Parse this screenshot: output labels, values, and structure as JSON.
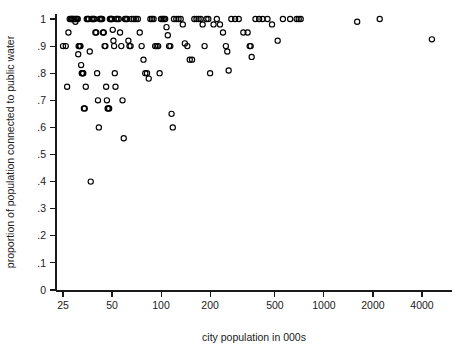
{
  "chart_data": {
    "type": "scatter",
    "title": "",
    "xlabel": "city population in 000s",
    "ylabel": "proportion of population connected to public water",
    "xscale": "log",
    "yscale": "linear",
    "xlim": [
      22,
      5200
    ],
    "ylim": [
      0,
      1.03
    ],
    "grid": false,
    "legend": null,
    "x_ticks": [
      25,
      50,
      100,
      200,
      500,
      1000,
      2000,
      4000
    ],
    "x_tick_labels": [
      "25",
      "50",
      "100",
      "200",
      "500",
      "1000",
      "2000",
      "4000"
    ],
    "y_ticks": [
      0,
      0.1,
      0.2,
      0.3,
      0.4,
      0.5,
      0.6,
      0.7,
      0.8,
      0.9,
      1
    ],
    "y_tick_labels": [
      "0",
      ".1",
      ".2",
      ".3",
      ".4",
      ".5",
      ".6",
      ".7",
      ".8",
      ".9",
      "1"
    ],
    "marker": {
      "shape": "circle-open",
      "radius": 2.6,
      "color": "#000000"
    },
    "series": [
      {
        "name": "cities",
        "points": [
          [
            25,
            0.9
          ],
          [
            26,
            0.9
          ],
          [
            26.5,
            0.75
          ],
          [
            27,
            0.95
          ],
          [
            27.5,
            1.0
          ],
          [
            28,
            1.0
          ],
          [
            28.3,
            1.0
          ],
          [
            28.6,
            1.0
          ],
          [
            29,
            1.0
          ],
          [
            29.4,
            1.0
          ],
          [
            29.8,
            0.99
          ],
          [
            30,
            1.0
          ],
          [
            30.4,
            1.0
          ],
          [
            30.8,
            1.0
          ],
          [
            31,
            0.87
          ],
          [
            31.2,
            0.9
          ],
          [
            31.5,
            0.9
          ],
          [
            31.8,
            0.9
          ],
          [
            32,
            0.9
          ],
          [
            32.3,
            0.83
          ],
          [
            32.6,
            0.8
          ],
          [
            32.9,
            0.8
          ],
          [
            33,
            0.8
          ],
          [
            33.3,
            0.8
          ],
          [
            33.6,
            0.67
          ],
          [
            34,
            0.67
          ],
          [
            34.5,
            0.75
          ],
          [
            35,
            1.0
          ],
          [
            35.5,
            1.0
          ],
          [
            36,
            1.0
          ],
          [
            36.5,
            0.88
          ],
          [
            37,
            0.4
          ],
          [
            37.5,
            1.0
          ],
          [
            38,
            1.0
          ],
          [
            38.5,
            1.0
          ],
          [
            39,
            1.0
          ],
          [
            39.5,
            0.95
          ],
          [
            40,
            0.95
          ],
          [
            40.5,
            0.8
          ],
          [
            41,
            0.7
          ],
          [
            41.5,
            0.6
          ],
          [
            42,
            1.0
          ],
          [
            42.5,
            1.0
          ],
          [
            43,
            1.0
          ],
          [
            43.5,
            1.0
          ],
          [
            44,
            0.95
          ],
          [
            44.5,
            0.95
          ],
          [
            45,
            0.9
          ],
          [
            45.5,
            0.9
          ],
          [
            46,
            0.75
          ],
          [
            46.5,
            0.7
          ],
          [
            47,
            0.67
          ],
          [
            47.5,
            0.67
          ],
          [
            48,
            0.67
          ],
          [
            48.5,
            1.0
          ],
          [
            49,
            1.0
          ],
          [
            49.5,
            1.0
          ],
          [
            50,
            1.0
          ],
          [
            50.5,
            0.96
          ],
          [
            51,
            0.92
          ],
          [
            51.5,
            0.9
          ],
          [
            52,
            0.8
          ],
          [
            52.5,
            0.75
          ],
          [
            53,
            1.0
          ],
          [
            54,
            1.0
          ],
          [
            55,
            1.0
          ],
          [
            56,
            0.95
          ],
          [
            57,
            0.9
          ],
          [
            58,
            0.7
          ],
          [
            59,
            0.56
          ],
          [
            60,
            1.0
          ],
          [
            61,
            1.0
          ],
          [
            62,
            1.0
          ],
          [
            63,
            0.92
          ],
          [
            64,
            0.9
          ],
          [
            65,
            0.9
          ],
          [
            66,
            1.0
          ],
          [
            68,
            1.0
          ],
          [
            70,
            1.0
          ],
          [
            72,
            1.0
          ],
          [
            74,
            0.95
          ],
          [
            76,
            0.9
          ],
          [
            78,
            0.85
          ],
          [
            80,
            0.8
          ],
          [
            82,
            0.8
          ],
          [
            84,
            0.78
          ],
          [
            86,
            1.0
          ],
          [
            88,
            1.0
          ],
          [
            90,
            1.0
          ],
          [
            92,
            0.9
          ],
          [
            94,
            0.9
          ],
          [
            96,
            0.9
          ],
          [
            98,
            0.8
          ],
          [
            100,
            1.0
          ],
          [
            102,
            1.0
          ],
          [
            104,
            1.0
          ],
          [
            106,
            1.0
          ],
          [
            108,
            0.97
          ],
          [
            110,
            0.94
          ],
          [
            112,
            0.9
          ],
          [
            114,
            0.9
          ],
          [
            116,
            0.65
          ],
          [
            118,
            0.6
          ],
          [
            120,
            1.0
          ],
          [
            124,
            1.0
          ],
          [
            128,
            1.0
          ],
          [
            132,
            1.0
          ],
          [
            136,
            0.98
          ],
          [
            140,
            0.91
          ],
          [
            145,
            0.9
          ],
          [
            150,
            0.85
          ],
          [
            155,
            0.85
          ],
          [
            160,
            1.0
          ],
          [
            165,
            1.0
          ],
          [
            170,
            1.0
          ],
          [
            175,
            1.0
          ],
          [
            180,
            0.98
          ],
          [
            185,
            0.9
          ],
          [
            190,
            1.0
          ],
          [
            195,
            1.0
          ],
          [
            200,
            0.8
          ],
          [
            210,
            0.98
          ],
          [
            220,
            1.0
          ],
          [
            230,
            0.98
          ],
          [
            240,
            0.95
          ],
          [
            250,
            0.9
          ],
          [
            255,
            0.88
          ],
          [
            260,
            0.81
          ],
          [
            270,
            1.0
          ],
          [
            285,
            1.0
          ],
          [
            300,
            1.0
          ],
          [
            320,
            0.95
          ],
          [
            340,
            0.95
          ],
          [
            350,
            0.9
          ],
          [
            355,
            0.9
          ],
          [
            360,
            0.86
          ],
          [
            380,
            1.0
          ],
          [
            400,
            1.0
          ],
          [
            420,
            1.0
          ],
          [
            450,
            1.0
          ],
          [
            480,
            0.98
          ],
          [
            520,
            0.92
          ],
          [
            560,
            1.0
          ],
          [
            620,
            1.0
          ],
          [
            680,
            1.0
          ],
          [
            700,
            1.0
          ],
          [
            720,
            1.0
          ],
          [
            1600,
            0.99
          ],
          [
            2200,
            1.0
          ],
          [
            4600,
            0.925
          ]
        ]
      }
    ]
  },
  "axes": {
    "y_axis_title": "proportion of population connected to public water",
    "x_axis_title": "city population in 000s"
  }
}
